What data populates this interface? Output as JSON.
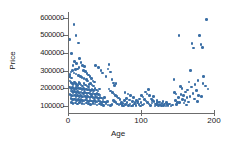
{
  "chart_data": {
    "type": "scatter",
    "title": "",
    "xlabel": "Age",
    "ylabel": "Price",
    "xlim": [
      0,
      200
    ],
    "ylim": [
      60000,
      620000
    ],
    "xticks": [
      0,
      100,
      200
    ],
    "xtick_labels": [
      "0",
      "100",
      "200"
    ],
    "yticks": [
      100000,
      200000,
      300000,
      400000,
      500000,
      600000
    ],
    "ytick_labels": [
      "100000",
      "200000",
      "300000",
      "400000",
      "500000",
      "600000"
    ],
    "grid": false,
    "legend": null,
    "marker_color": "#3a6ea5",
    "axis_color": "#6c6c6c",
    "background": "#ffffff",
    "series": [
      {
        "name": "Houses",
        "points": [
          [
            2,
            475000
          ],
          [
            8,
            560000
          ],
          [
            11,
            498000
          ],
          [
            14,
            455000
          ],
          [
            5,
            398000
          ],
          [
            9,
            352000
          ],
          [
            12,
            340000
          ],
          [
            7,
            330000
          ],
          [
            16,
            368000
          ],
          [
            18,
            345000
          ],
          [
            20,
            330000
          ],
          [
            23,
            322000
          ],
          [
            15,
            318000
          ],
          [
            13,
            310000
          ],
          [
            10,
            305000
          ],
          [
            6,
            300000
          ],
          [
            4,
            292000
          ],
          [
            3,
            278000
          ],
          [
            2,
            265000
          ],
          [
            5,
            258000
          ],
          [
            8,
            286000
          ],
          [
            11,
            280000
          ],
          [
            14,
            272000
          ],
          [
            17,
            268000
          ],
          [
            19,
            262000
          ],
          [
            21,
            300000
          ],
          [
            24,
            295000
          ],
          [
            26,
            282000
          ],
          [
            28,
            274000
          ],
          [
            22,
            256000
          ],
          [
            25,
            248000
          ],
          [
            27,
            240000
          ],
          [
            30,
            268000
          ],
          [
            32,
            255000
          ],
          [
            34,
            242000
          ],
          [
            36,
            236000
          ],
          [
            31,
            228000
          ],
          [
            29,
            222000
          ],
          [
            33,
            218000
          ],
          [
            35,
            212000
          ],
          [
            3,
            240000
          ],
          [
            4,
            232000
          ],
          [
            6,
            226000
          ],
          [
            7,
            220000
          ],
          [
            9,
            236000
          ],
          [
            10,
            228000
          ],
          [
            12,
            222000
          ],
          [
            13,
            216000
          ],
          [
            15,
            232000
          ],
          [
            16,
            226000
          ],
          [
            18,
            218000
          ],
          [
            20,
            212000
          ],
          [
            22,
            226000
          ],
          [
            24,
            218000
          ],
          [
            26,
            212000
          ],
          [
            28,
            206000
          ],
          [
            2,
            208000
          ],
          [
            3,
            202000
          ],
          [
            5,
            198000
          ],
          [
            6,
            205000
          ],
          [
            8,
            200000
          ],
          [
            9,
            196000
          ],
          [
            11,
            204000
          ],
          [
            12,
            198000
          ],
          [
            14,
            202000
          ],
          [
            15,
            196000
          ],
          [
            17,
            200000
          ],
          [
            19,
            194000
          ],
          [
            21,
            198000
          ],
          [
            23,
            192000
          ],
          [
            25,
            196000
          ],
          [
            27,
            190000
          ],
          [
            29,
            194000
          ],
          [
            31,
            188000
          ],
          [
            33,
            192000
          ],
          [
            35,
            186000
          ],
          [
            37,
            198000
          ],
          [
            39,
            190000
          ],
          [
            41,
            184000
          ],
          [
            43,
            196000
          ],
          [
            4,
            185000
          ],
          [
            6,
            180000
          ],
          [
            7,
            176000
          ],
          [
            9,
            182000
          ],
          [
            10,
            178000
          ],
          [
            12,
            174000
          ],
          [
            13,
            180000
          ],
          [
            15,
            176000
          ],
          [
            16,
            172000
          ],
          [
            18,
            178000
          ],
          [
            20,
            174000
          ],
          [
            21,
            170000
          ],
          [
            23,
            176000
          ],
          [
            25,
            172000
          ],
          [
            26,
            168000
          ],
          [
            28,
            174000
          ],
          [
            30,
            170000
          ],
          [
            32,
            166000
          ],
          [
            34,
            172000
          ],
          [
            36,
            168000
          ],
          [
            38,
            164000
          ],
          [
            40,
            170000
          ],
          [
            42,
            166000
          ],
          [
            44,
            162000
          ],
          [
            3,
            165000
          ],
          [
            5,
            160000
          ],
          [
            7,
            156000
          ],
          [
            8,
            162000
          ],
          [
            10,
            158000
          ],
          [
            11,
            154000
          ],
          [
            13,
            160000
          ],
          [
            14,
            156000
          ],
          [
            16,
            152000
          ],
          [
            17,
            158000
          ],
          [
            19,
            154000
          ],
          [
            20,
            150000
          ],
          [
            22,
            156000
          ],
          [
            24,
            152000
          ],
          [
            25,
            148000
          ],
          [
            27,
            154000
          ],
          [
            29,
            150000
          ],
          [
            30,
            146000
          ],
          [
            32,
            152000
          ],
          [
            34,
            148000
          ],
          [
            36,
            144000
          ],
          [
            38,
            150000
          ],
          [
            40,
            146000
          ],
          [
            42,
            142000
          ],
          [
            44,
            148000
          ],
          [
            46,
            144000
          ],
          [
            48,
            140000
          ],
          [
            50,
            146000
          ],
          [
            4,
            142000
          ],
          [
            6,
            138000
          ],
          [
            8,
            134000
          ],
          [
            9,
            140000
          ],
          [
            11,
            136000
          ],
          [
            12,
            132000
          ],
          [
            14,
            138000
          ],
          [
            15,
            134000
          ],
          [
            17,
            130000
          ],
          [
            18,
            136000
          ],
          [
            20,
            132000
          ],
          [
            22,
            128000
          ],
          [
            24,
            134000
          ],
          [
            26,
            130000
          ],
          [
            28,
            126000
          ],
          [
            30,
            132000
          ],
          [
            32,
            128000
          ],
          [
            34,
            124000
          ],
          [
            36,
            130000
          ],
          [
            38,
            126000
          ],
          [
            40,
            122000
          ],
          [
            42,
            128000
          ],
          [
            44,
            124000
          ],
          [
            46,
            120000
          ],
          [
            48,
            126000
          ],
          [
            50,
            122000
          ],
          [
            52,
            118000
          ],
          [
            54,
            124000
          ],
          [
            5,
            118000
          ],
          [
            7,
            114000
          ],
          [
            10,
            116000
          ],
          [
            13,
            112000
          ],
          [
            16,
            118000
          ],
          [
            19,
            114000
          ],
          [
            22,
            110000
          ],
          [
            25,
            116000
          ],
          [
            28,
            112000
          ],
          [
            31,
            108000
          ],
          [
            34,
            114000
          ],
          [
            37,
            110000
          ],
          [
            40,
            106000
          ],
          [
            43,
            112000
          ],
          [
            46,
            108000
          ],
          [
            49,
            104000
          ],
          [
            52,
            110000
          ],
          [
            55,
            106000
          ],
          [
            58,
            102000
          ],
          [
            60,
            108000
          ],
          [
            38,
            330000
          ],
          [
            42,
            318000
          ],
          [
            45,
            300000
          ],
          [
            47,
            286000
          ],
          [
            52,
            268000
          ],
          [
            55,
            310000
          ],
          [
            56,
            335000
          ],
          [
            58,
            292000
          ],
          [
            60,
            248000
          ],
          [
            62,
            230000
          ],
          [
            64,
            214000
          ],
          [
            66,
            226000
          ],
          [
            56,
            196000
          ],
          [
            58,
            184000
          ],
          [
            61,
            176000
          ],
          [
            63,
            168000
          ],
          [
            65,
            160000
          ],
          [
            67,
            152000
          ],
          [
            69,
            144000
          ],
          [
            71,
            136000
          ],
          [
            62,
            130000
          ],
          [
            64,
            124000
          ],
          [
            66,
            118000
          ],
          [
            68,
            112000
          ],
          [
            70,
            106000
          ],
          [
            72,
            110000
          ],
          [
            74,
            104000
          ],
          [
            76,
            100000
          ],
          [
            73,
            120000
          ],
          [
            75,
            114000
          ],
          [
            77,
            130000
          ],
          [
            79,
            108000
          ],
          [
            81,
            118000
          ],
          [
            83,
            104000
          ],
          [
            85,
            112000
          ],
          [
            87,
            100000
          ],
          [
            78,
            176000
          ],
          [
            82,
            168000
          ],
          [
            86,
            158000
          ],
          [
            80,
            142000
          ],
          [
            84,
            134000
          ],
          [
            88,
            126000
          ],
          [
            90,
            148000
          ],
          [
            92,
            120000
          ],
          [
            89,
            102000
          ],
          [
            91,
            110000
          ],
          [
            93,
            104000
          ],
          [
            95,
            116000
          ],
          [
            97,
            108000
          ],
          [
            99,
            100000
          ],
          [
            94,
            132000
          ],
          [
            96,
            124000
          ],
          [
            98,
            140000
          ],
          [
            100,
            118000
          ],
          [
            102,
            106000
          ],
          [
            104,
            112000
          ],
          [
            101,
            160000
          ],
          [
            103,
            150000
          ],
          [
            105,
            138000
          ],
          [
            107,
            128000
          ],
          [
            106,
            178000
          ],
          [
            108,
            168000
          ],
          [
            110,
            192000
          ],
          [
            112,
            158000
          ],
          [
            109,
            120000
          ],
          [
            111,
            112000
          ],
          [
            113,
            104000
          ],
          [
            115,
            116000
          ],
          [
            114,
            140000
          ],
          [
            116,
            132000
          ],
          [
            118,
            124000
          ],
          [
            120,
            110000
          ],
          [
            117,
            152000
          ],
          [
            119,
            100000
          ],
          [
            121,
            108000
          ],
          [
            123,
            118000
          ],
          [
            122,
            130000
          ],
          [
            124,
            104000
          ],
          [
            126,
            112000
          ],
          [
            128,
            100000
          ],
          [
            125,
            122000
          ],
          [
            127,
            106000
          ],
          [
            129,
            114000
          ],
          [
            131,
            102000
          ],
          [
            130,
            126000
          ],
          [
            132,
            110000
          ],
          [
            134,
            100000
          ],
          [
            136,
            108000
          ],
          [
            135,
            118000
          ],
          [
            137,
            104000
          ],
          [
            139,
            112000
          ],
          [
            141,
            100000
          ],
          [
            143,
            106000
          ],
          [
            145,
            250000
          ],
          [
            146,
            176000
          ],
          [
            148,
            168000
          ],
          [
            150,
            120000
          ],
          [
            152,
            500000
          ],
          [
            154,
            210000
          ],
          [
            156,
            198000
          ],
          [
            158,
            158000
          ],
          [
            160,
            130000
          ],
          [
            162,
            105000
          ],
          [
            164,
            190000
          ],
          [
            166,
            236000
          ],
          [
            168,
            300000
          ],
          [
            170,
            452000
          ],
          [
            172,
            428000
          ],
          [
            174,
            222000
          ],
          [
            176,
            186000
          ],
          [
            178,
            244000
          ],
          [
            180,
            500000
          ],
          [
            182,
            448000
          ],
          [
            184,
            432000
          ],
          [
            186,
            268000
          ],
          [
            188,
            212000
          ],
          [
            190,
            590000
          ],
          [
            192,
            196000
          ],
          [
            183,
            152000
          ],
          [
            185,
            228000
          ],
          [
            179,
            160000
          ],
          [
            177,
            124000
          ],
          [
            173,
            140000
          ],
          [
            171,
            170000
          ],
          [
            169,
            208000
          ],
          [
            167,
            152000
          ],
          [
            165,
            122000
          ],
          [
            163,
            146000
          ],
          [
            161,
            178000
          ],
          [
            159,
            116000
          ],
          [
            157,
            136000
          ],
          [
            155,
            166000
          ],
          [
            153,
            118000
          ],
          [
            151,
            148000
          ],
          [
            149,
            108000
          ],
          [
            147,
            132000
          ]
        ]
      }
    ]
  },
  "axes": {
    "y_title": "Price",
    "x_title": "Age"
  }
}
